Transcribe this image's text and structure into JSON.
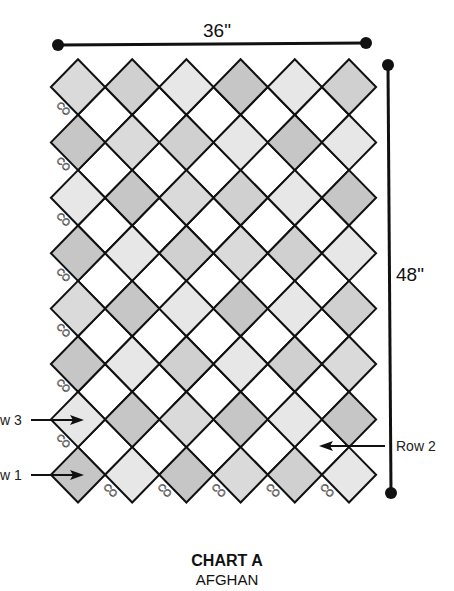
{
  "title": "CHART A",
  "subtitle": "AFGHAN",
  "dimensions": {
    "width_label": "36\"",
    "height_label": "48\""
  },
  "row_labels": [
    {
      "text": "w 3",
      "full": "Row 3",
      "side": "left"
    },
    {
      "text": "w 1",
      "full": "Row 1",
      "side": "left"
    },
    {
      "text": "Row 2",
      "full": "Row 2",
      "side": "right"
    }
  ],
  "co_label": "CO",
  "colors": {
    "D": "#c6c6c6",
    "M": "#d0d0d0",
    "L2": "#dadada",
    "L": "#e7e7e7",
    "interstitial": "#ffffff",
    "outline": "#111111"
  },
  "grid": {
    "columns": 6,
    "rows": 8,
    "shading": [
      [
        "L2",
        "M",
        "L",
        "D",
        "L",
        "M"
      ],
      [
        "D",
        "L2",
        "M",
        "L",
        "D",
        "L"
      ],
      [
        "L",
        "D",
        "L2",
        "M",
        "L",
        "D"
      ],
      [
        "D",
        "L",
        "M",
        "L2",
        "M",
        "L"
      ],
      [
        "L2",
        "D",
        "L",
        "D",
        "L",
        "M"
      ],
      [
        "D",
        "L",
        "M",
        "L",
        "M",
        "L2"
      ],
      [
        "L",
        "D",
        "L2",
        "D",
        "L",
        "D"
      ],
      [
        "D",
        "L",
        "D",
        "L2",
        "M",
        "L"
      ]
    ]
  }
}
